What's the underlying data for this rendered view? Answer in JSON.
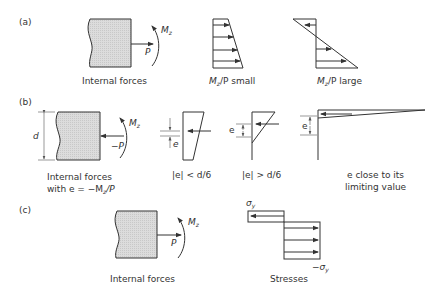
{
  "figure": {
    "panels": [
      {
        "id": "a",
        "label": "(a)",
        "captions": {
          "internal_forces": "Internal forces",
          "small_prefix": "M",
          "small_sub": "z",
          "small_suffix": "/P small",
          "large_prefix": "M",
          "large_sub": "z",
          "large_suffix": "/P large"
        },
        "symbols": {
          "force": "P",
          "moment": "M",
          "moment_sub": "z"
        }
      },
      {
        "id": "b",
        "label": "(b)",
        "captions": {
          "internal_forces_1": "Internal forces",
          "internal_forces_2_prefix": "with e = −M",
          "internal_forces_2_sub": "z",
          "internal_forces_2_suffix": "/P",
          "case1": "|e| < d/6",
          "case2": "|e| > d/6",
          "case3_1": "e close to its",
          "case3_2": "limiting value"
        },
        "symbols": {
          "depth": "d",
          "force": "−P",
          "moment": "M",
          "moment_sub": "z",
          "ecc": "e"
        }
      },
      {
        "id": "c",
        "label": "(c)",
        "captions": {
          "internal_forces": "Internal forces",
          "stresses": "Stresses"
        },
        "symbols": {
          "force": "P",
          "moment": "M",
          "moment_sub": "z",
          "sigma_top": "σ",
          "sigma_top_sub": "y",
          "sigma_bot": "−σ",
          "sigma_bot_sub": "y"
        }
      }
    ]
  }
}
